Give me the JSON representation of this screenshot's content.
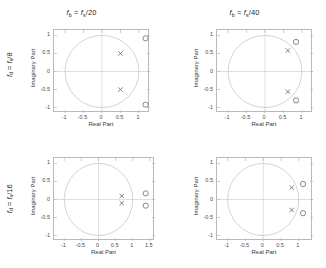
{
  "figure": {
    "width": 326,
    "height": 268,
    "background": "#ffffff",
    "axis_color": "#b9b9b9",
    "circle_color": "#c9c9c9",
    "crosshair_color": "#d2d2d2",
    "marker_color": "#6b6b6b"
  },
  "axis_labels": {
    "x": "Real Part",
    "y": "Imaginary Part"
  },
  "row_labels": [
    {
      "text": "f_d = f_s/8",
      "prefix": "f",
      "sub1": "d",
      "mid": " = f",
      "sub2": "s",
      "suffix": "/8"
    },
    {
      "text": "f_d = f_s/16",
      "prefix": "f",
      "sub1": "d",
      "mid": " = f",
      "sub2": "s",
      "suffix": "/16"
    }
  ],
  "column_titles": [
    {
      "text": "f_b = f_s/20",
      "prefix": "f",
      "sub1": "b",
      "mid": " = f",
      "sub2": "s",
      "suffix": "/20"
    },
    {
      "text": "f_b = f_s/40",
      "prefix": "f",
      "sub1": "b",
      "mid": " = f",
      "sub2": "s",
      "suffix": "/40"
    }
  ],
  "chart_data": [
    {
      "id": "panel-top-left",
      "type": "scatter",
      "title": "f_b = f_s/20",
      "row_label": "f_d = f_s/8",
      "xlabel": "Real Part",
      "ylabel": "Imaginary Part",
      "xlim": [
        -1.3,
        1.3
      ],
      "ylim": [
        -1.15,
        1.15
      ],
      "xticks": [
        -1,
        -0.5,
        0,
        0.5,
        1
      ],
      "xticklabels": [
        "-1",
        "-0.5",
        "0",
        "0.5",
        "1"
      ],
      "yticks": [
        -1,
        -0.5,
        0,
        0.5,
        1
      ],
      "yticklabels": [
        "-1",
        "-0.5",
        "0",
        "0.5",
        "1"
      ],
      "grid": false,
      "unit_circle": true,
      "crosshair": true,
      "series": [
        {
          "name": "zeros",
          "marker": "o",
          "points": [
            [
              1.18,
              0.92
            ],
            [
              1.18,
              -0.92
            ]
          ]
        },
        {
          "name": "poles",
          "marker": "x",
          "points": [
            [
              0.5,
              0.5
            ],
            [
              0.5,
              -0.5
            ]
          ]
        }
      ]
    },
    {
      "id": "panel-top-right",
      "type": "scatter",
      "title": "f_b = f_s/40",
      "row_label": "f_d = f_s/8",
      "xlabel": "Real Part",
      "ylabel": "Imaginary Part",
      "xlim": [
        -1.3,
        1.3
      ],
      "ylim": [
        -1.15,
        1.15
      ],
      "xticks": [
        -1,
        -0.5,
        0,
        0.5,
        1
      ],
      "xticklabels": [
        "-1",
        "-0.5",
        "0",
        "0.5",
        "1"
      ],
      "yticks": [
        -1,
        -0.5,
        0,
        0.5,
        1
      ],
      "yticklabels": [
        "-1",
        "-0.5",
        "0",
        "0.5",
        "1"
      ],
      "grid": false,
      "unit_circle": true,
      "crosshair": true,
      "series": [
        {
          "name": "zeros",
          "marker": "o",
          "points": [
            [
              0.84,
              0.82
            ],
            [
              0.84,
              -0.8
            ]
          ]
        },
        {
          "name": "poles",
          "marker": "x",
          "points": [
            [
              0.62,
              0.58
            ],
            [
              0.62,
              -0.56
            ]
          ]
        }
      ]
    },
    {
      "id": "panel-bottom-left",
      "type": "scatter",
      "title": "f_b = f_s/20",
      "row_label": "f_d = f_s/16",
      "xlabel": "Real Part",
      "ylabel": "Imaginary Part",
      "xlim": [
        -1.3,
        1.65
      ],
      "ylim": [
        -1.15,
        1.15
      ],
      "xticks": [
        -1,
        -0.5,
        0,
        0.5,
        1,
        1.5
      ],
      "xticklabels": [
        "-1",
        "-0.5",
        "0",
        "0.5",
        "1",
        "1.5"
      ],
      "yticks": [
        -1,
        -0.5,
        0,
        0.5,
        1
      ],
      "yticklabels": [
        "-1",
        "-0.5",
        "0",
        "0.5",
        "1"
      ],
      "grid": false,
      "unit_circle": true,
      "crosshair": true,
      "series": [
        {
          "name": "zeros",
          "marker": "o",
          "points": [
            [
              1.38,
              0.17
            ],
            [
              1.38,
              -0.17
            ]
          ]
        },
        {
          "name": "poles",
          "marker": "x",
          "points": [
            [
              0.68,
              0.1
            ],
            [
              0.68,
              -0.1
            ]
          ]
        }
      ]
    },
    {
      "id": "panel-bottom-right",
      "type": "scatter",
      "title": "f_b = f_s/40",
      "row_label": "f_d = f_s/16",
      "xlabel": "Real Part",
      "ylabel": "Imaginary Part",
      "xlim": [
        -1.3,
        1.4
      ],
      "ylim": [
        -1.15,
        1.15
      ],
      "xticks": [
        -1,
        -0.5,
        0,
        0.5,
        1
      ],
      "xticklabels": [
        "-1",
        "-0.5",
        "0",
        "0.5",
        "1"
      ],
      "yticks": [
        -1,
        -0.5,
        0,
        0.5,
        1
      ],
      "yticklabels": [
        "-1",
        "-0.5",
        "0",
        "0.5",
        "1"
      ],
      "grid": false,
      "unit_circle": true,
      "crosshair": true,
      "series": [
        {
          "name": "zeros",
          "marker": "o",
          "points": [
            [
              1.12,
              0.43
            ],
            [
              1.12,
              -0.38
            ]
          ]
        },
        {
          "name": "poles",
          "marker": "x",
          "points": [
            [
              0.8,
              0.33
            ],
            [
              0.8,
              -0.29
            ]
          ]
        }
      ]
    }
  ]
}
